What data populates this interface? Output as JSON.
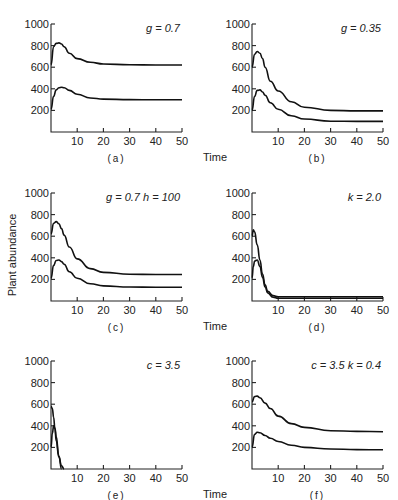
{
  "figure": {
    "y_axis_title": "Plant abundance",
    "x_axis_title": "Time"
  },
  "chart_data": [
    {
      "type": "line",
      "panel": "a",
      "caption": "(a)",
      "annotation": "g = 0.7",
      "xlabel": "",
      "ylabel": "",
      "xlim": [
        0,
        50
      ],
      "ylim": [
        0,
        1000
      ],
      "xticks": [
        10,
        20,
        30,
        40,
        50
      ],
      "yticks": [
        200,
        400,
        600,
        800,
        1000
      ],
      "grid": false,
      "series": [
        {
          "name": "upper",
          "x": [
            0,
            1,
            2,
            3,
            4,
            5,
            7,
            10,
            15,
            20,
            30,
            40,
            50
          ],
          "y": [
            620,
            790,
            820,
            825,
            815,
            790,
            730,
            680,
            645,
            630,
            622,
            620,
            620
          ]
        },
        {
          "name": "lower",
          "x": [
            0,
            1,
            2,
            3,
            4,
            5,
            7,
            10,
            15,
            20,
            30,
            40,
            50
          ],
          "y": [
            210,
            330,
            390,
            410,
            415,
            410,
            385,
            350,
            315,
            305,
            300,
            298,
            298
          ]
        }
      ]
    },
    {
      "type": "line",
      "panel": "b",
      "caption": "(b)",
      "annotation": "g = 0.35",
      "xlim": [
        0,
        50
      ],
      "ylim": [
        0,
        1000
      ],
      "xticks": [
        10,
        20,
        30,
        40,
        50
      ],
      "yticks": [
        200,
        400,
        600,
        800,
        1000
      ],
      "grid": false,
      "series": [
        {
          "name": "upper",
          "x": [
            0,
            1,
            2,
            3,
            4,
            5,
            7,
            10,
            15,
            20,
            30,
            40,
            50
          ],
          "y": [
            600,
            720,
            745,
            730,
            680,
            600,
            470,
            380,
            280,
            230,
            200,
            195,
            195
          ]
        },
        {
          "name": "lower",
          "x": [
            0,
            1,
            2,
            3,
            4,
            5,
            7,
            10,
            15,
            20,
            30,
            40,
            50
          ],
          "y": [
            200,
            330,
            385,
            390,
            370,
            340,
            270,
            210,
            150,
            120,
            100,
            98,
            98
          ]
        }
      ]
    },
    {
      "type": "line",
      "panel": "c",
      "caption": "(c)",
      "annotation": "g = 0.7   h = 100",
      "xlim": [
        0,
        50
      ],
      "ylim": [
        0,
        1000
      ],
      "xticks": [
        10,
        20,
        30,
        40,
        50
      ],
      "yticks": [
        200,
        400,
        600,
        800,
        1000
      ],
      "grid": false,
      "series": [
        {
          "name": "upper",
          "x": [
            0,
            1,
            2,
            3,
            4,
            5,
            7,
            10,
            15,
            20,
            30,
            40,
            50
          ],
          "y": [
            620,
            720,
            735,
            715,
            670,
            610,
            500,
            390,
            300,
            265,
            248,
            245,
            245
          ]
        },
        {
          "name": "lower",
          "x": [
            0,
            1,
            2,
            3,
            4,
            5,
            7,
            10,
            15,
            20,
            30,
            40,
            50
          ],
          "y": [
            210,
            330,
            375,
            380,
            365,
            340,
            270,
            210,
            160,
            140,
            130,
            128,
            128
          ]
        }
      ]
    },
    {
      "type": "line",
      "panel": "d",
      "caption": "(d)",
      "annotation": "k = 2.0",
      "xlim": [
        0,
        50
      ],
      "ylim": [
        0,
        1000
      ],
      "xticks": [
        10,
        20,
        30,
        40,
        50
      ],
      "yticks": [
        200,
        400,
        600,
        800,
        1000
      ],
      "grid": false,
      "series": [
        {
          "name": "upper",
          "x": [
            0,
            0.5,
            1,
            2,
            3,
            4,
            5,
            6,
            8,
            10,
            20,
            30,
            40,
            50
          ],
          "y": [
            600,
            660,
            640,
            520,
            380,
            250,
            150,
            90,
            50,
            40,
            40,
            40,
            40,
            40
          ]
        },
        {
          "name": "lower",
          "x": [
            0,
            0.5,
            1,
            2,
            3,
            4,
            5,
            6,
            8,
            10,
            20,
            30,
            40,
            50
          ],
          "y": [
            210,
            320,
            370,
            380,
            320,
            220,
            130,
            75,
            35,
            25,
            25,
            25,
            25,
            25
          ]
        }
      ]
    },
    {
      "type": "line",
      "panel": "e",
      "caption": "(e)",
      "annotation": "c = 3.5",
      "xlim": [
        0,
        50
      ],
      "ylim": [
        0,
        1000
      ],
      "xticks": [
        10,
        20,
        30,
        40,
        50
      ],
      "yticks": [
        200,
        400,
        600,
        800,
        1000
      ],
      "grid": false,
      "series": [
        {
          "name": "upper",
          "x": [
            0,
            0.5,
            1,
            1.5,
            2,
            3,
            4,
            5
          ],
          "y": [
            580,
            560,
            480,
            370,
            260,
            110,
            30,
            0
          ]
        },
        {
          "name": "lower",
          "x": [
            0,
            0.5,
            1,
            1.5,
            2,
            3,
            4
          ],
          "y": [
            200,
            330,
            400,
            380,
            300,
            120,
            0
          ]
        }
      ]
    },
    {
      "type": "line",
      "panel": "f",
      "caption": "(f)",
      "annotation": "c = 3.5   k = 0.4",
      "xlim": [
        0,
        50
      ],
      "ylim": [
        0,
        1000
      ],
      "xticks": [
        10,
        20,
        30,
        40,
        50
      ],
      "yticks": [
        200,
        400,
        600,
        800,
        1000
      ],
      "grid": false,
      "series": [
        {
          "name": "upper",
          "x": [
            0,
            1,
            2,
            3,
            5,
            7,
            10,
            15,
            20,
            30,
            40,
            50
          ],
          "y": [
            620,
            670,
            675,
            660,
            610,
            560,
            490,
            420,
            385,
            355,
            348,
            345
          ]
        },
        {
          "name": "lower",
          "x": [
            0,
            1,
            2,
            3,
            5,
            7,
            10,
            15,
            20,
            30,
            40,
            50
          ],
          "y": [
            200,
            320,
            340,
            335,
            310,
            285,
            255,
            220,
            200,
            185,
            180,
            178
          ]
        }
      ]
    }
  ],
  "panels": [
    {
      "caption": "(a)",
      "annotation": "g = 0.7",
      "show_time": false
    },
    {
      "caption": "(b)",
      "annotation": "g = 0.35",
      "show_time": true
    },
    {
      "caption": "(c)",
      "annotation": "g = 0.7   h = 100",
      "show_time": false
    },
    {
      "caption": "(d)",
      "annotation": "k = 2.0",
      "show_time": true
    },
    {
      "caption": "(e)",
      "annotation": "c = 3.5",
      "show_time": false
    },
    {
      "caption": "(f)",
      "annotation": "c = 3.5   k = 0.4",
      "show_time": true
    }
  ]
}
